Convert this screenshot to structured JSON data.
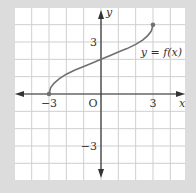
{
  "chart_data": {
    "type": "line",
    "title": "",
    "xlabel": "x",
    "ylabel": "y",
    "xlim": [
      -5,
      5
    ],
    "ylim": [
      -5,
      5
    ],
    "grid": true,
    "grid_step": 1,
    "x_ticks": [
      {
        "value": -3,
        "label": "−3"
      },
      {
        "value": 3,
        "label": "3"
      }
    ],
    "y_ticks": [
      {
        "value": 3,
        "label": "3"
      },
      {
        "value": -3,
        "label": "−3"
      }
    ],
    "origin_label": "O",
    "series": [
      {
        "name": "y = f(x)",
        "label": "y = f(x)",
        "x": [
          -3,
          -2.9,
          -2.7,
          -2.4,
          -2,
          -1.5,
          -1,
          -0.5,
          0,
          0.5,
          1,
          1.5,
          2,
          2.4,
          2.7,
          2.9,
          3
        ],
        "y": [
          0,
          0.37,
          0.63,
          0.89,
          1.14,
          1.38,
          1.58,
          1.79,
          2,
          2.21,
          2.42,
          2.62,
          2.86,
          3.11,
          3.37,
          3.63,
          4
        ],
        "endpoints": [
          {
            "x": -3,
            "y": 0
          },
          {
            "x": 3,
            "y": 4
          }
        ]
      }
    ],
    "colors": {
      "background": "#dcdcdc",
      "plot_area": "#ffffff",
      "grid": "#cfcfcf",
      "axis": "#333333",
      "curve": "#707070"
    }
  }
}
